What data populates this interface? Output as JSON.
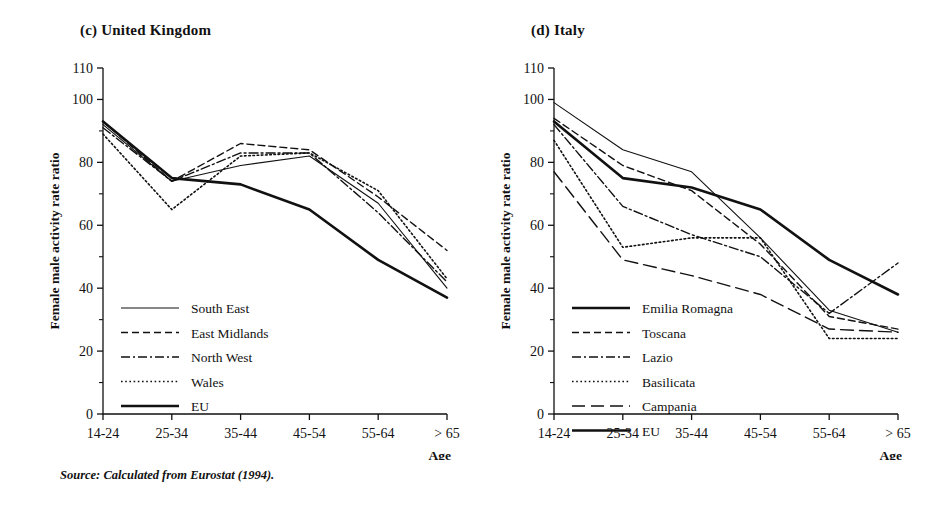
{
  "source_note": "Source: Calculated from Eurostat (1994).",
  "axis": {
    "ylabel": "Female male activity rate ratio",
    "xlabel": "Age",
    "ytick_labels": [
      "0",
      "20",
      "40",
      "60",
      "80",
      "100",
      "110"
    ],
    "ytick_values": [
      0,
      20,
      40,
      60,
      80,
      100,
      110
    ],
    "yminor_values": [
      10,
      30,
      50,
      70,
      90
    ],
    "categories": [
      "14-24",
      "25-34",
      "35-44",
      "45-54",
      "55-64",
      "> 65"
    ]
  },
  "chart_data": [
    {
      "type": "line",
      "title": "(c) United Kingdom",
      "xlabel": "Age",
      "ylabel": "Female male activity rate ratio",
      "categories": [
        "14-24",
        "25-34",
        "35-44",
        "45-54",
        "55-64",
        "> 65"
      ],
      "ylim": [
        0,
        110
      ],
      "grid": false,
      "legend_position": "lower-left",
      "series": [
        {
          "name": "South East",
          "style": "solid-thin",
          "values": [
            92,
            74,
            79,
            82,
            67,
            40
          ]
        },
        {
          "name": "East Midlands",
          "style": "dashed",
          "values": [
            93,
            74,
            86,
            84,
            69,
            52
          ]
        },
        {
          "name": "North West",
          "style": "dash-dot",
          "values": [
            91,
            74,
            83,
            83,
            64,
            42
          ]
        },
        {
          "name": "Wales",
          "style": "dotted",
          "values": [
            89,
            65,
            82,
            83,
            71,
            43
          ]
        },
        {
          "name": "EU",
          "style": "solid-thick",
          "values": [
            93,
            75,
            73,
            65,
            49,
            37
          ]
        }
      ]
    },
    {
      "type": "line",
      "title": "(d) Italy",
      "xlabel": "Age",
      "ylabel": "Female male activity rate ratio",
      "categories": [
        "14-24",
        "25-34",
        "35-44",
        "45-54",
        "55-64",
        "> 65"
      ],
      "ylim": [
        0,
        110
      ],
      "grid": false,
      "legend_position": "lower-left",
      "series": [
        {
          "name": "Emilia Romagna",
          "style": "solid-thick",
          "values": [
            93,
            75,
            72,
            65,
            49,
            38
          ]
        },
        {
          "name": "Toscana",
          "style": "dashed",
          "values": [
            94,
            79,
            71,
            54,
            31,
            27
          ]
        },
        {
          "name": "Lazio",
          "style": "dash-dot",
          "values": [
            92,
            66,
            57,
            50,
            32,
            48
          ]
        },
        {
          "name": "Basilicata",
          "style": "dotted",
          "values": [
            87,
            53,
            56,
            56,
            24,
            24
          ]
        },
        {
          "name": "Campania",
          "style": "long-dash",
          "values": [
            77,
            49,
            44,
            38,
            27,
            26
          ]
        },
        {
          "name": "Toscana thin",
          "style": "solid-thin",
          "values": [
            99,
            84,
            77,
            56,
            33,
            26
          ]
        }
      ]
    }
  ],
  "uk_legend": [
    {
      "label": "South East",
      "style": "solid-thin"
    },
    {
      "label": "East Midlands",
      "style": "dashed"
    },
    {
      "label": "North West",
      "style": "dash-dot"
    },
    {
      "label": "Wales",
      "style": "dotted"
    },
    {
      "label": "EU",
      "style": "solid-thick"
    }
  ],
  "it_legend": [
    {
      "label": "Emilia Romagna",
      "style": "solid-thick"
    },
    {
      "label": "Toscana",
      "style": "dashed"
    },
    {
      "label": "Lazio",
      "style": "dash-dot"
    },
    {
      "label": "Basilicata",
      "style": "dotted"
    },
    {
      "label": "Campania",
      "style": "long-dash"
    },
    {
      "label": "EU",
      "style": "solid-thick"
    }
  ],
  "colors": {
    "ink": "#111111",
    "paper": "#ffffff"
  }
}
